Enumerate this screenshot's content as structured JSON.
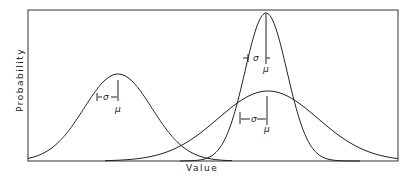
{
  "chart_data": {
    "type": "line",
    "title": "",
    "xlabel": "Value",
    "ylabel": "Probability",
    "grid": false,
    "legend": null,
    "series": [
      {
        "name": "left distribution",
        "mean_px": 118,
        "peak_px": 74,
        "sigma_label": "σ",
        "mean_label": "μ",
        "shape": "moderate width"
      },
      {
        "name": "narrow distribution",
        "mean_px": 266,
        "peak_px": 13,
        "sigma_label": "σ",
        "mean_label": "μ",
        "shape": "narrow, tall"
      },
      {
        "name": "wide distribution",
        "mean_px": 268,
        "peak_px": 91,
        "sigma_label": "σ",
        "mean_label": "μ",
        "shape": "wide, short"
      }
    ],
    "annotations": [
      "σ",
      "μ",
      "σ",
      "μ",
      "σ",
      "μ"
    ]
  },
  "labels": {
    "x": "Value",
    "y": "Probability",
    "sigma": "σ",
    "mu": "μ"
  }
}
